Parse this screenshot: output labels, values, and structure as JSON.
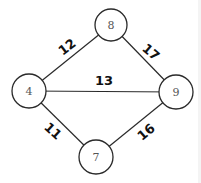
{
  "diagram": {
    "type": "weighted-undirected-graph",
    "nodes": [
      {
        "id": "n8",
        "label": "8",
        "x": 111,
        "y": 25,
        "r": 16
      },
      {
        "id": "n4",
        "label": "4",
        "x": 29,
        "y": 91,
        "r": 17
      },
      {
        "id": "n9",
        "label": "9",
        "x": 176,
        "y": 92,
        "r": 17
      },
      {
        "id": "n7",
        "label": "7",
        "x": 96,
        "y": 157,
        "r": 17
      }
    ],
    "edges": [
      {
        "from": "4",
        "to": "8",
        "weight": "12",
        "label_x": 67,
        "label_y": 47,
        "label_rotate": -38
      },
      {
        "from": "8",
        "to": "9",
        "weight": "17",
        "label_x": 151,
        "label_y": 52,
        "label_rotate": 40
      },
      {
        "from": "4",
        "to": "9",
        "weight": "13",
        "label_x": 104,
        "label_y": 80,
        "label_rotate": 0
      },
      {
        "from": "4",
        "to": "7",
        "weight": "11",
        "label_x": 53,
        "label_y": 131,
        "label_rotate": 42
      },
      {
        "from": "7",
        "to": "9",
        "weight": "16",
        "label_x": 146,
        "label_y": 132,
        "label_rotate": -40
      }
    ],
    "colors": {
      "line": "#2a2a2a",
      "node_text": "#555555",
      "weight_text": "#111111",
      "background": "#ffffff"
    }
  }
}
